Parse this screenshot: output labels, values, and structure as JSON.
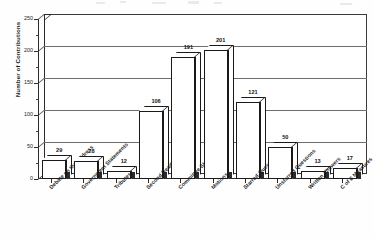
{
  "chart_data": {
    "type": "bar",
    "title": "",
    "subtitle": "",
    "xlabel": "",
    "ylabel": "Number of Contributions",
    "ylim": [
      0,
      250
    ],
    "ytick_step": 50,
    "yticks": [
      "0",
      "50",
      "100",
      "150",
      "200",
      "250"
    ],
    "grid": true,
    "legend": "none",
    "style": "3d-bar",
    "categories": [
      "Debate on the Address",
      "Government Statements",
      "Tributes",
      "Second Readings",
      "Committee Stages",
      "Motions",
      "Starred Questions",
      "Unstarred Questions",
      "Written Answers",
      "C of E Measures"
    ],
    "values": [
      29,
      28,
      12,
      106,
      191,
      201,
      121,
      50,
      13,
      17
    ],
    "value_labels": [
      "29",
      "28",
      "12",
      "106",
      "191",
      "201",
      "121",
      "50",
      "13",
      "17"
    ]
  },
  "colors": {
    "bar_face": "#ffffff",
    "bar_outline": "#1a1a1a",
    "gridline": "#6d6d6d",
    "axis": "#2a2a2a",
    "text": "#1b1b1b",
    "background": "#ffffff"
  }
}
